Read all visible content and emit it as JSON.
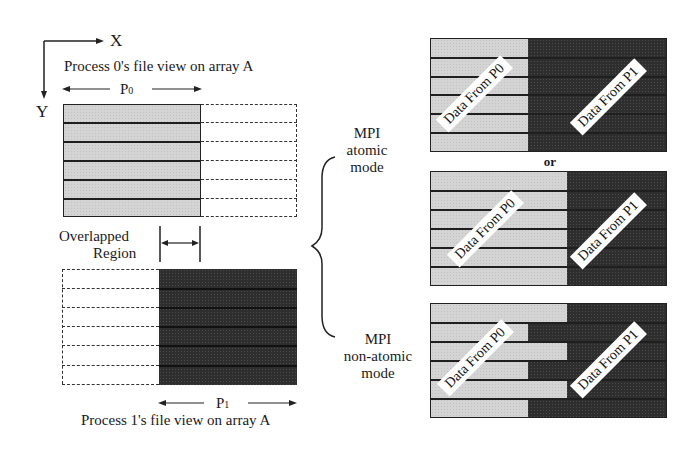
{
  "axes": {
    "x_label": "X",
    "y_label": "Y"
  },
  "process0": {
    "title": "Process 0's file view on array A",
    "span_label": "P",
    "span_sub": "0",
    "rows": 6
  },
  "overlap": {
    "label_line1": "Overlapped",
    "label_line2": "Region"
  },
  "process1": {
    "title": "Process 1's file view on array A",
    "span_label": "P",
    "span_sub": "1",
    "rows": 6
  },
  "modes": {
    "atomic": {
      "line1": "MPI",
      "line2": "atomic",
      "line3": "mode"
    },
    "nonatomic": {
      "line1": "MPI",
      "line2": "non-atomic",
      "line3": "mode"
    },
    "or_label": "or"
  },
  "results": [
    {
      "id": "atomic-result-1",
      "p0_label": "Data From P0",
      "p1_label": "Data From P1",
      "split_x": 527,
      "pattern": "uniform"
    },
    {
      "id": "atomic-result-2",
      "p0_label": "Data From P0",
      "p1_label": "Data From P1",
      "split_x": 566,
      "pattern": "uniform"
    },
    {
      "id": "nonatomic-result",
      "p0_label": "Data From P0",
      "p1_label": "Data From P1",
      "split_x": [
        566,
        527,
        566,
        527,
        566,
        527
      ],
      "pattern": "interleaved"
    }
  ],
  "colors": {
    "light_fill": "#d4d4d4",
    "dark_fill": "#2e2e2e",
    "line": "#1f1f1f"
  }
}
